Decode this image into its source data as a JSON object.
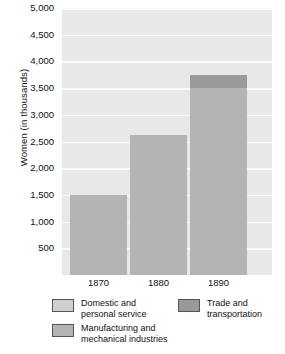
{
  "chart_data": {
    "type": "bar",
    "title": "",
    "subtitle": "",
    "xlabel": "",
    "ylabel": "Women (in thousands)",
    "categories": [
      "1870",
      "1880",
      "1890"
    ],
    "ylim": [
      0,
      5000
    ],
    "ytick_labels": [
      "5,000",
      "4,500",
      "4,000",
      "3,500",
      "3,000",
      "2,500",
      "2,000",
      "1,500",
      "1,000",
      "500"
    ],
    "ytick_values": [
      5000,
      4500,
      4000,
      3500,
      3000,
      2500,
      2000,
      1500,
      1000,
      500
    ],
    "grid": true,
    "stacked": true,
    "legend_position": "bottom",
    "series": [
      {
        "name": "Manufacturing and\nmechanical industries",
        "color": "#b4b4b4",
        "values": [
          1500,
          2625,
          3500
        ]
      },
      {
        "name": "Trade and\ntransportation",
        "color": "#9a9a9a",
        "values": [
          0,
          0,
          250
        ]
      }
    ],
    "totals": [
      1500,
      2625,
      3750
    ]
  },
  "axis": {
    "y_title": "Women (in thousands)",
    "y_ticks": [
      "5,000",
      "4,500",
      "4,000",
      "3,500",
      "3,000",
      "2,500",
      "2,000",
      "1,500",
      "1,000",
      "500"
    ],
    "x_ticks": [
      "1870",
      "1880",
      "1890"
    ]
  },
  "legend": {
    "items": [
      {
        "key": "domestic",
        "label": "Domestic and\npersonal service",
        "color": "#cfcfcf"
      },
      {
        "key": "trade",
        "label": "Trade and\ntransportation",
        "color": "#9a9a9a"
      },
      {
        "key": "manufacturing",
        "label": "Manufacturing and\nmechanical industries",
        "color": "#b4b4b4"
      }
    ]
  },
  "colors": {
    "plot_background": "#e8e8e8",
    "gridline": "#fbfbfb",
    "bar_manufacturing": "#b4b4b4",
    "bar_trade": "#9a9a9a",
    "bar_domestic": "#cfcfcf",
    "text": "#111111"
  }
}
